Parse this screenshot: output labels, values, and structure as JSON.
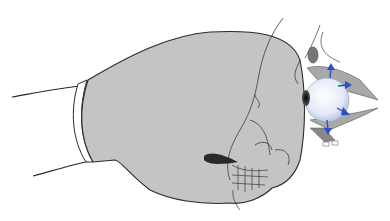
{
  "figure": {
    "colors": {
      "glove_fill": "#c4c4c4",
      "outline": "#2a2a2a",
      "eye_fill": "#eef2fb",
      "arrow": "#2f4fc4",
      "bone_fill": "#9a9a9a",
      "background": "#ffffff"
    },
    "arrows": [
      {
        "direction": "up",
        "x": 330,
        "y": 66
      },
      {
        "direction": "right",
        "x": 347,
        "y": 84
      },
      {
        "direction": "right-down",
        "x": 344,
        "y": 111
      },
      {
        "direction": "down",
        "x": 328,
        "y": 128
      }
    ]
  }
}
